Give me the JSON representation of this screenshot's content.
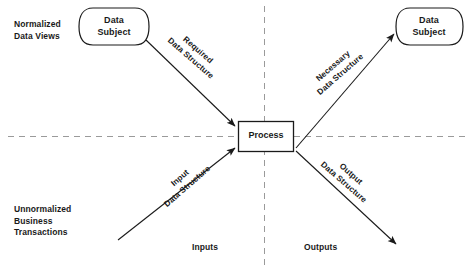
{
  "diagram": {
    "stroke_color": "#1a1a1a",
    "dash_color": "#9a9a9a",
    "background": "#ffffff",
    "nodes": {
      "data_subject_left": {
        "label": "Data\nSubject",
        "shape": "rounded-cylinder"
      },
      "data_subject_right": {
        "label": "Data\nSubject",
        "shape": "rounded-cylinder"
      },
      "process": {
        "label": "Process",
        "shape": "rectangle"
      }
    },
    "quadrant_labels": {
      "top_left": "Normalized\nData Views",
      "bottom_left": "Unnormalized\nBusiness\nTransactions",
      "bottom_center_left": "Inputs",
      "bottom_center_right": "Outputs"
    },
    "edges": [
      {
        "id": "required",
        "label": "Required\nData Structure",
        "from": "data_subject_left",
        "to": "process",
        "direction": "down-right"
      },
      {
        "id": "necessary",
        "label": "Necessary\nData Structure",
        "from": "process",
        "to": "data_subject_right",
        "direction": "up-right"
      },
      {
        "id": "input",
        "label": "Input\nData Structure",
        "from": "lower-left-origin",
        "to": "process",
        "direction": "up-right"
      },
      {
        "id": "output",
        "label": "Output\nData Structure",
        "from": "process",
        "to": "lower-right-target",
        "direction": "down-right"
      }
    ],
    "axes": {
      "horizontal_divider": "dashed",
      "vertical_divider": "dashed"
    }
  }
}
